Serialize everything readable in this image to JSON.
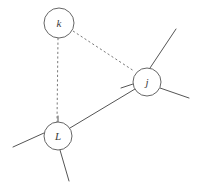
{
  "figure": {
    "background_color": "#ffffff",
    "solid_edge_color": "#555555",
    "dashed_edge_color": "#7a7a7a",
    "node_fill_color": "#ffffff",
    "node_stroke_color": "#666666",
    "label_color": "#3a3a3a"
  },
  "nodes": [
    {
      "id": "k",
      "label": "k",
      "cx": 59,
      "cy": 23,
      "r": 15
    },
    {
      "id": "j",
      "label": "j",
      "cx": 147,
      "cy": 82,
      "r": 14
    },
    {
      "id": "L",
      "label": "L",
      "cx": 58,
      "cy": 136,
      "r": 14
    }
  ],
  "edges": [
    {
      "from": "k",
      "to": "L",
      "style": "dashed",
      "x1": 58,
      "y1": 38,
      "x2": 57,
      "y2": 122
    },
    {
      "from": "k",
      "to": "j",
      "style": "dashed",
      "x1": 73,
      "y1": 31,
      "x2": 134,
      "y2": 71
    },
    {
      "from": "L",
      "to": "j",
      "style": "solid",
      "x1": 70,
      "y1": 128,
      "x2": 135,
      "y2": 89
    }
  ],
  "stubs": [
    {
      "node": "j",
      "direction": "up-right",
      "x1": 150,
      "y1": 68,
      "x2": 176,
      "y2": 29
    },
    {
      "node": "j",
      "direction": "down-right",
      "x1": 160,
      "y1": 88,
      "x2": 189,
      "y2": 98
    },
    {
      "node": "j",
      "direction": "left",
      "x1": 133,
      "y1": 84,
      "x2": 121,
      "y2": 88
    },
    {
      "node": "L",
      "direction": "left",
      "x1": 44,
      "y1": 133,
      "x2": 13,
      "y2": 147
    },
    {
      "node": "L",
      "direction": "down",
      "x1": 60,
      "y1": 150,
      "x2": 69,
      "y2": 181
    },
    {
      "node": "L",
      "direction": "up",
      "x1": 58,
      "y1": 122,
      "x2": 58,
      "y2": 116
    }
  ]
}
